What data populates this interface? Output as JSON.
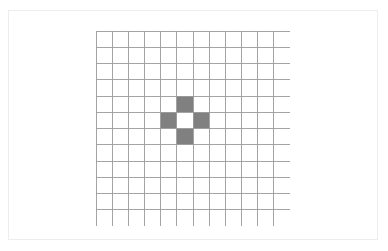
{
  "figure": {
    "title": "",
    "background_color": "#ffffff",
    "frame_border_color": "#ededed"
  },
  "chart_data": {
    "type": "heatmap",
    "title": "",
    "xlabel": "",
    "ylabel": "",
    "grid": true,
    "grid_on": true,
    "legend_position": "none",
    "rows": 12,
    "columns": 12,
    "xlim": [
      0,
      12
    ],
    "ylim": [
      0,
      12
    ],
    "categories": [
      "0",
      "1",
      "2",
      "3",
      "4",
      "5",
      "6",
      "7",
      "8",
      "9",
      "10",
      "11"
    ],
    "tick_labels_x": [],
    "tick_labels_y": [],
    "cell_colors": {
      "empty": "#ffffff",
      "filled": "#808080",
      "gridline": "#9a9a9a"
    },
    "filled_cells": [
      {
        "row": 4,
        "col": 5
      },
      {
        "row": 5,
        "col": 4
      },
      {
        "row": 5,
        "col": 6
      },
      {
        "row": 6,
        "col": 5
      }
    ],
    "pattern_name": "plus-cross",
    "values": [
      [
        0,
        0,
        0,
        0,
        0,
        0,
        0,
        0,
        0,
        0,
        0,
        0
      ],
      [
        0,
        0,
        0,
        0,
        0,
        0,
        0,
        0,
        0,
        0,
        0,
        0
      ],
      [
        0,
        0,
        0,
        0,
        0,
        0,
        0,
        0,
        0,
        0,
        0,
        0
      ],
      [
        0,
        0,
        0,
        0,
        0,
        0,
        0,
        0,
        0,
        0,
        0,
        0
      ],
      [
        0,
        0,
        0,
        0,
        0,
        1,
        0,
        0,
        0,
        0,
        0,
        0
      ],
      [
        0,
        0,
        0,
        0,
        1,
        0,
        1,
        0,
        0,
        0,
        0,
        0
      ],
      [
        0,
        0,
        0,
        0,
        0,
        1,
        0,
        0,
        0,
        0,
        0,
        0
      ],
      [
        0,
        0,
        0,
        0,
        0,
        0,
        0,
        0,
        0,
        0,
        0,
        0
      ],
      [
        0,
        0,
        0,
        0,
        0,
        0,
        0,
        0,
        0,
        0,
        0,
        0
      ],
      [
        0,
        0,
        0,
        0,
        0,
        0,
        0,
        0,
        0,
        0,
        0,
        0
      ],
      [
        0,
        0,
        0,
        0,
        0,
        0,
        0,
        0,
        0,
        0,
        0,
        0
      ],
      [
        0,
        0,
        0,
        0,
        0,
        0,
        0,
        0,
        0,
        0,
        0,
        0
      ]
    ]
  }
}
